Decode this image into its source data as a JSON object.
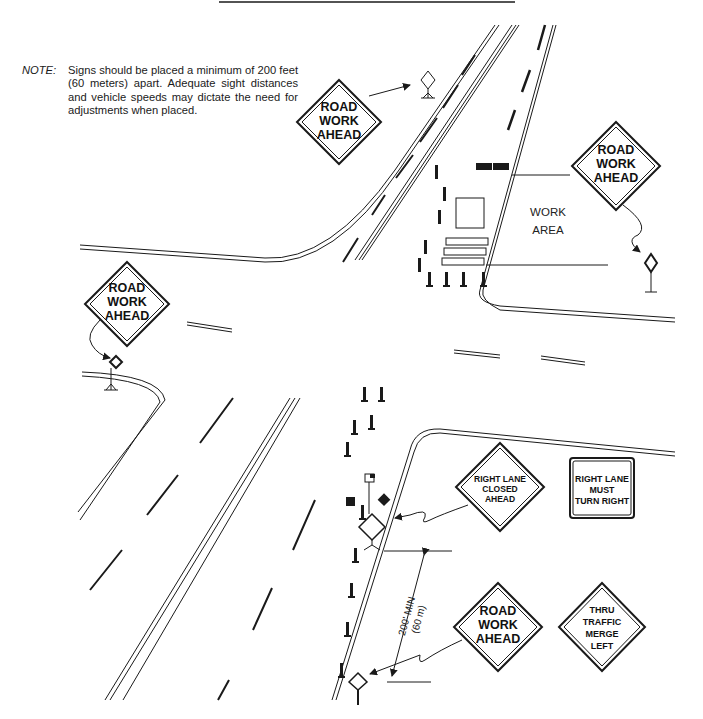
{
  "note": {
    "label": "NOTE:",
    "text": "Signs should be placed a minimum of 200 feet (60 meters) apart. Adequate sight distances and vehicle speeds may dictate the need for adjustments when placed."
  },
  "signs": {
    "top_center": {
      "line1": "ROAD",
      "line2": "WORK",
      "line3": "AHEAD"
    },
    "top_right": {
      "line1": "ROAD",
      "line2": "WORK",
      "line3": "AHEAD"
    },
    "left": {
      "line1": "ROAD",
      "line2": "WORK",
      "line3": "AHEAD"
    },
    "right_lane_closed": {
      "line1": "RIGHT LANE",
      "line2": "CLOSED",
      "line3": "AHEAD"
    },
    "right_lane_must_turn": {
      "line1": "RIGHT LANE",
      "line2": "MUST",
      "line3": "TURN RIGHT"
    },
    "bottom_road_work": {
      "line1": "ROAD",
      "line2": "WORK",
      "line3": "AHEAD"
    },
    "thru_traffic": {
      "line1": "THRU",
      "line2": "TRAFFIC",
      "line3": "MERGE",
      "line4": "LEFT"
    }
  },
  "work_area": {
    "line1": "WORK",
    "line2": "AREA"
  },
  "dimension": {
    "line1": "200' MIN",
    "line2": "(60 m)"
  },
  "colors": {
    "ink": "#1a1a1a",
    "background": "#ffffff"
  }
}
